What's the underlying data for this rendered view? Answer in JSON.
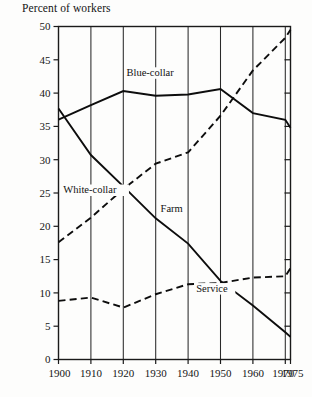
{
  "chart_data": {
    "type": "line",
    "title": "Percent of workers",
    "xlabel": "",
    "ylabel": "",
    "ylim": [
      0,
      50
    ],
    "xlim": [
      1900,
      1975
    ],
    "grid": "vertical",
    "legend_position": "inline-annotations",
    "y_ticks": [
      0,
      5,
      10,
      15,
      20,
      25,
      30,
      35,
      40,
      45,
      50
    ],
    "y_tick_labels": [
      "0",
      "5",
      "10",
      "15",
      "20",
      "25",
      "30",
      "35",
      "40",
      "45",
      "50"
    ],
    "x_ticks": [
      1900,
      1910,
      1920,
      1930,
      1940,
      1950,
      1960,
      1970,
      1975
    ],
    "x_tick_labels": [
      "1900",
      "1910",
      "1920",
      "1930",
      "1940",
      "1950",
      "1960",
      "1970",
      "1975"
    ],
    "x": [
      1900,
      1910,
      1920,
      1930,
      1940,
      1950,
      1960,
      1970,
      1975
    ],
    "series": [
      {
        "name": "Blue-collar",
        "style": "solid",
        "label_x": 1921,
        "label_y": 42.6,
        "values": [
          36.0,
          38.2,
          40.3,
          39.6,
          39.8,
          40.6,
          37.0,
          36.0,
          34.8
        ]
      },
      {
        "name": "White-collar",
        "style": "dashed",
        "label_x": 1901.5,
        "label_y": 25.0,
        "values": [
          17.6,
          21.3,
          25.6,
          29.4,
          31.1,
          36.6,
          43.4,
          48.3,
          49.5
        ]
      },
      {
        "name": "Farm",
        "style": "solid",
        "label_x": 1931.5,
        "label_y": 22.2,
        "values": [
          37.7,
          30.7,
          26.0,
          21.2,
          17.4,
          11.8,
          8.1,
          4.1,
          3.4
        ]
      },
      {
        "name": "Service",
        "style": "dashed",
        "label_x": 1942.5,
        "label_y": 10.2,
        "values": [
          8.8,
          9.3,
          7.8,
          9.8,
          11.3,
          11.5,
          12.3,
          12.5,
          13.7
        ]
      }
    ]
  },
  "colors": {
    "ink": "#0d0d0d",
    "grid": "#2a2a2a",
    "background": "#fdfdfc"
  }
}
